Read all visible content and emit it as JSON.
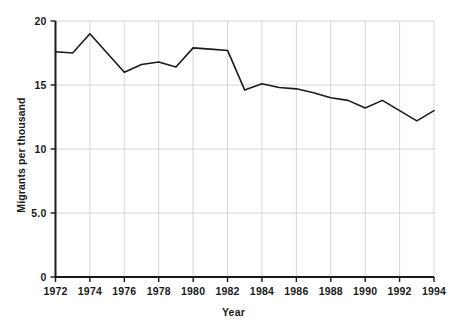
{
  "chart_data": {
    "type": "line",
    "title": "",
    "xlabel": "Year",
    "ylabel": "Migrants per thousand",
    "xlim": [
      1972,
      1994
    ],
    "ylim": [
      0,
      20
    ],
    "grid": true,
    "legend": false,
    "y_ticks": [
      {
        "value": 20,
        "label": "20"
      },
      {
        "value": 15,
        "label": "15"
      },
      {
        "value": 10,
        "label": "10"
      },
      {
        "value": 5,
        "label": "5.0"
      },
      {
        "value": 0,
        "label": "0"
      }
    ],
    "x_ticks": [
      {
        "value": 1972,
        "label": "1972"
      },
      {
        "value": 1974,
        "label": "1974"
      },
      {
        "value": 1976,
        "label": "1976"
      },
      {
        "value": 1978,
        "label": "1978"
      },
      {
        "value": 1980,
        "label": "1980"
      },
      {
        "value": 1982,
        "label": "1982"
      },
      {
        "value": 1984,
        "label": "1984"
      },
      {
        "value": 1986,
        "label": "1986"
      },
      {
        "value": 1988,
        "label": "1988"
      },
      {
        "value": 1990,
        "label": "1990"
      },
      {
        "value": 1992,
        "label": "1992"
      },
      {
        "value": 1994,
        "label": "1994"
      }
    ],
    "x": [
      1972,
      1973,
      1974,
      1975,
      1976,
      1977,
      1978,
      1979,
      1980,
      1981,
      1982,
      1983,
      1984,
      1985,
      1986,
      1987,
      1988,
      1989,
      1990,
      1991,
      1992,
      1993,
      1994
    ],
    "values": [
      17.6,
      17.5,
      19.0,
      17.5,
      16.0,
      16.6,
      16.8,
      16.4,
      17.9,
      17.8,
      17.7,
      14.6,
      15.1,
      14.8,
      14.7,
      14.4,
      14.0,
      13.8,
      13.2,
      13.8,
      13.0,
      12.2,
      13.0
    ],
    "series_name": "Migrants per thousand",
    "line_color": "#1a1a1a",
    "line_width": 1.6,
    "grid_color": "#cccccc",
    "axis_color": "#1a1a1a",
    "background": "#ffffff"
  }
}
